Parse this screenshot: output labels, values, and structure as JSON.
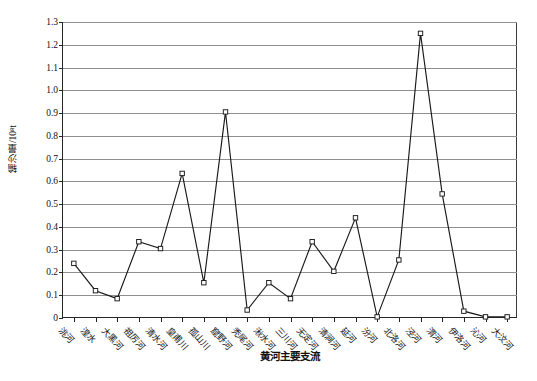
{
  "chart_data": {
    "type": "line",
    "title": "",
    "xlabel": "黄河主要支流",
    "ylabel": "输沙量/10⁸t",
    "ylim": [
      0,
      1.3
    ],
    "ytick_step": 0.1,
    "grid": true,
    "legend": "none",
    "marker": "open-square",
    "line_color": "#1a1a1a",
    "grid_color": "#8f8f8f",
    "axis_color": "#262626",
    "categories": [
      "洮河",
      "湟水",
      "大黑河",
      "祖厉河",
      "清水河",
      "皇甫川",
      "孤山川",
      "窟野河",
      "秃尾河",
      "湫水河",
      "三川河",
      "无定河",
      "清涧河",
      "延河",
      "汾河",
      "北洛河",
      "泾河",
      "渭河",
      "伊洛河",
      "沁河",
      "大汶河"
    ],
    "values": [
      0.24,
      0.12,
      0.085,
      0.335,
      0.305,
      0.635,
      0.155,
      0.905,
      0.035,
      0.155,
      0.085,
      0.335,
      0.205,
      0.44,
      0.005,
      0.255,
      1.25,
      0.545,
      0.03,
      0.005,
      0.005
    ],
    "ytick_labels": [
      "0",
      "0.1",
      "0.2",
      "0.3",
      "0.4",
      "0.5",
      "0.6",
      "0.7",
      "0.8",
      "0.9",
      "1.0",
      "1.1",
      "1.2",
      "1.3"
    ]
  },
  "caption": ""
}
